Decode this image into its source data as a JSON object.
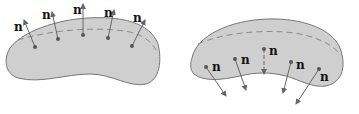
{
  "diagram": {
    "colors": {
      "surface_fill": "#cfcfcf",
      "surface_stroke": "#777777",
      "arrow": "#666666",
      "dot": "#555555",
      "dashed_line": "#8a8a8a"
    },
    "left_surface": {
      "description": "convex surface with outward normals",
      "normals": [
        {
          "label": "n"
        },
        {
          "label": "n"
        },
        {
          "label": "n"
        },
        {
          "label": "n"
        },
        {
          "label": "n"
        }
      ]
    },
    "right_surface": {
      "description": "surface with inward/downward normals",
      "normals": [
        {
          "label": "n"
        },
        {
          "label": "n"
        },
        {
          "label": "n"
        },
        {
          "label": "n"
        },
        {
          "label": "n"
        }
      ]
    }
  }
}
